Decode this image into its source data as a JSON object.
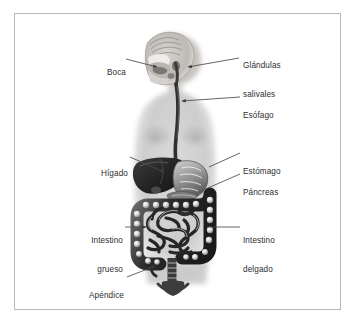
{
  "figure": {
    "language": "es",
    "background_color": "#ffffff",
    "frame_color": "#b9b9b9",
    "label_color": "#2e2e2e",
    "leader_line_color": "#4a4a4a",
    "body_silhouette_color": "#d0d0d0",
    "organ_dark_color": "#2b2b2b"
  },
  "labels": [
    {
      "id": "boca",
      "text": "Boca",
      "side": "left",
      "lines": [
        "Boca"
      ],
      "x": 100,
      "y": 53,
      "leader": {
        "from_x": 126,
        "from_y": 60,
        "to_x": 158,
        "to_y": 66,
        "arrow": true
      }
    },
    {
      "id": "glandulas-salivales",
      "text": "Glándulas salivales",
      "side": "right",
      "lines": [
        "Glándulas",
        "salivales"
      ],
      "x": 243,
      "y": 46,
      "leader": {
        "from_x": 239,
        "from_y": 58,
        "to_x": 186,
        "to_y": 66,
        "arrow": true
      }
    },
    {
      "id": "esofago",
      "text": "Esófago",
      "side": "right",
      "lines": [
        "Esófago"
      ],
      "x": 243,
      "y": 95,
      "leader": {
        "from_x": 239,
        "from_y": 98,
        "to_x": 182,
        "to_y": 100,
        "arrow": true
      }
    },
    {
      "id": "higado",
      "text": "Hígado",
      "side": "left",
      "lines": [
        "Hígado"
      ],
      "x": 90,
      "y": 152,
      "leader": {
        "from_x": 129,
        "from_y": 157,
        "to_x": 166,
        "to_y": 172,
        "arrow": true
      }
    },
    {
      "id": "estomago",
      "text": "Estómago",
      "side": "right",
      "lines": [
        "Estómago"
      ],
      "x": 243,
      "y": 151,
      "leader": {
        "from_x": 240,
        "from_y": 154,
        "to_x": 208,
        "to_y": 169,
        "arrow": false
      }
    },
    {
      "id": "pancreas",
      "text": "Páncreas",
      "side": "right",
      "lines": [
        "Páncreas"
      ],
      "x": 243,
      "y": 172,
      "leader": {
        "from_x": 240,
        "from_y": 175,
        "to_x": 200,
        "to_y": 190,
        "arrow": false
      }
    },
    {
      "id": "intestino-grueso",
      "text": "Intestino grueso",
      "side": "left",
      "lines": [
        "Intestino",
        "grueso"
      ],
      "x": 82,
      "y": 222,
      "leader": {
        "from_x": 125,
        "from_y": 227,
        "to_x": 148,
        "to_y": 227,
        "arrow": true
      }
    },
    {
      "id": "intestino-delgado",
      "text": "Intestino delgado",
      "side": "right",
      "lines": [
        "Intestino",
        "delgado"
      ],
      "x": 243,
      "y": 222,
      "leader": {
        "from_x": 240,
        "from_y": 227,
        "to_x": 206,
        "to_y": 227,
        "arrow": false
      }
    },
    {
      "id": "apendice",
      "text": "Apéndice",
      "side": "left",
      "lines": [
        "Apéndice"
      ],
      "x": 84,
      "y": 277,
      "leader": {
        "from_x": 126,
        "from_y": 277,
        "to_x": 156,
        "to_y": 266,
        "arrow": true
      }
    }
  ],
  "organs": [
    {
      "id": "head-sagittal",
      "name": "cabeza-corte-sagital"
    },
    {
      "id": "torso",
      "name": "silueta-torso"
    },
    {
      "id": "esophagus",
      "name": "esofago"
    },
    {
      "id": "liver",
      "name": "higado"
    },
    {
      "id": "stomach",
      "name": "estomago"
    },
    {
      "id": "pancreas",
      "name": "pancreas"
    },
    {
      "id": "large-intestine",
      "name": "intestino-grueso"
    },
    {
      "id": "small-intestine",
      "name": "intestino-delgado"
    },
    {
      "id": "appendix",
      "name": "apendice"
    },
    {
      "id": "rectum",
      "name": "recto"
    }
  ]
}
